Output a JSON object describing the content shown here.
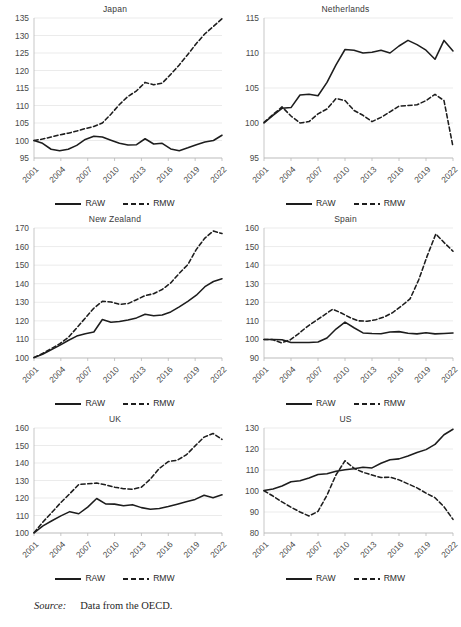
{
  "figure": {
    "source_label": "Source:",
    "source_text": "Data from the OECD.",
    "legend": {
      "raw": "RAW",
      "rmw": "RMW"
    },
    "colors": {
      "line": "#1d1d1d",
      "grid": "#e2e2e2",
      "axis": "#b9b9b9",
      "text": "#4a4a4a"
    }
  },
  "chart_data": [
    {
      "type": "line",
      "title": "Japan",
      "xlabel": "",
      "ylabel": "",
      "ylim": [
        95,
        135
      ],
      "yticks": [
        95,
        100,
        105,
        110,
        115,
        120,
        125,
        130,
        135
      ],
      "xlim": [
        2001,
        2022
      ],
      "xticks": [
        2001,
        2004,
        2007,
        2010,
        2013,
        2016,
        2019,
        2022
      ],
      "grid": true,
      "legend_position": "bottom",
      "x": [
        2001,
        2002,
        2003,
        2004,
        2005,
        2006,
        2007,
        2008,
        2009,
        2010,
        2011,
        2012,
        2013,
        2014,
        2015,
        2016,
        2017,
        2018,
        2019,
        2020,
        2021,
        2022
      ],
      "series": [
        {
          "name": "RAW",
          "style": "solid",
          "values": [
            100.0,
            99.2,
            97.5,
            97.1,
            97.5,
            98.6,
            100.3,
            101.2,
            101.0,
            100.1,
            99.2,
            98.7,
            98.8,
            100.5,
            99.0,
            99.2,
            97.6,
            97.1,
            97.9,
            98.8,
            99.6,
            100.0,
            101.5
          ]
        },
        {
          "name": "RMW",
          "style": "dashed",
          "values": [
            100.0,
            100.4,
            101.0,
            101.6,
            102.1,
            102.7,
            103.4,
            104.0,
            105.0,
            107.5,
            110.3,
            112.6,
            114.2,
            116.6,
            115.9,
            116.4,
            118.9,
            121.6,
            124.6,
            127.7,
            130.5,
            132.6,
            134.8
          ]
        }
      ]
    },
    {
      "type": "line",
      "title": "Netherlands",
      "xlabel": "",
      "ylabel": "",
      "ylim": [
        95,
        115
      ],
      "yticks": [
        95,
        100,
        105,
        110,
        115
      ],
      "xlim": [
        2001,
        2022
      ],
      "xticks": [
        2001,
        2004,
        2007,
        2010,
        2013,
        2016,
        2019,
        2022
      ],
      "grid": true,
      "legend_position": "bottom",
      "x": [
        2001,
        2002,
        2003,
        2004,
        2005,
        2006,
        2007,
        2008,
        2009,
        2010,
        2011,
        2012,
        2013,
        2014,
        2015,
        2016,
        2017,
        2018,
        2019,
        2020,
        2021,
        2022
      ],
      "series": [
        {
          "name": "RAW",
          "style": "solid",
          "values": [
            100.0,
            101.1,
            102.1,
            102.2,
            104.0,
            104.1,
            103.9,
            105.8,
            108.3,
            110.5,
            110.4,
            110.0,
            110.1,
            110.4,
            110.0,
            111.0,
            111.8,
            111.2,
            110.4,
            109.1,
            111.8,
            110.3
          ]
        },
        {
          "name": "RMW",
          "style": "dashed",
          "values": [
            100.1,
            101.2,
            102.3,
            101.0,
            100.0,
            100.2,
            101.3,
            102.0,
            103.5,
            103.2,
            101.8,
            101.1,
            100.2,
            100.8,
            101.6,
            102.4,
            102.5,
            102.6,
            103.2,
            104.1,
            103.2,
            96.6
          ]
        }
      ]
    },
    {
      "type": "line",
      "title": "New Zealand",
      "xlabel": "",
      "ylabel": "",
      "ylim": [
        100,
        170
      ],
      "yticks": [
        100,
        110,
        120,
        130,
        140,
        150,
        160,
        170
      ],
      "xlim": [
        2001,
        2022
      ],
      "xticks": [
        2001,
        2004,
        2007,
        2010,
        2013,
        2016,
        2019,
        2022
      ],
      "grid": true,
      "legend_position": "bottom",
      "x": [
        2001,
        2002,
        2003,
        2004,
        2005,
        2006,
        2007,
        2008,
        2009,
        2010,
        2011,
        2012,
        2013,
        2014,
        2015,
        2016,
        2017,
        2018,
        2019,
        2020,
        2021,
        2022
      ],
      "series": [
        {
          "name": "RAW",
          "style": "solid",
          "values": [
            100.2,
            102.0,
            104.4,
            106.8,
            109.4,
            111.8,
            113.1,
            114.0,
            120.7,
            119.3,
            119.6,
            120.5,
            121.6,
            123.6,
            122.8,
            123.2,
            124.8,
            127.5,
            130.5,
            133.8,
            138.4,
            141.2,
            142.7
          ]
        },
        {
          "name": "RMW",
          "style": "dashed",
          "values": [
            100.3,
            102.4,
            105.0,
            107.6,
            111.0,
            116.2,
            121.5,
            126.8,
            130.5,
            130.2,
            128.9,
            129.3,
            131.4,
            133.6,
            134.6,
            136.9,
            140.4,
            145.6,
            150.3,
            158.5,
            164.6,
            168.4,
            167.0
          ]
        }
      ]
    },
    {
      "type": "line",
      "title": "Spain",
      "xlabel": "",
      "ylabel": "",
      "ylim": [
        90,
        160
      ],
      "yticks": [
        90,
        100,
        110,
        120,
        130,
        140,
        150,
        160
      ],
      "xlim": [
        2001,
        2022
      ],
      "xticks": [
        2001,
        2004,
        2007,
        2010,
        2013,
        2016,
        2019,
        2022
      ],
      "grid": true,
      "legend_position": "bottom",
      "x": [
        2001,
        2002,
        2003,
        2004,
        2005,
        2006,
        2007,
        2008,
        2009,
        2010,
        2011,
        2012,
        2013,
        2014,
        2015,
        2016,
        2017,
        2018,
        2019,
        2020,
        2021,
        2022
      ],
      "series": [
        {
          "name": "RAW",
          "style": "solid",
          "values": [
            100.0,
            100.0,
            99.8,
            98.4,
            98.3,
            98.4,
            98.6,
            100.8,
            105.6,
            109.3,
            106.3,
            103.5,
            103.2,
            103.1,
            104.0,
            104.2,
            103.3,
            103.0,
            103.6,
            103.0,
            103.2,
            103.5
          ]
        },
        {
          "name": "RMW",
          "style": "dashed",
          "values": [
            100.0,
            99.9,
            98.2,
            99.6,
            103.0,
            106.8,
            110.0,
            113.1,
            116.3,
            114.2,
            111.8,
            110.0,
            109.8,
            110.6,
            112.1,
            114.5,
            118.0,
            121.8,
            132.0,
            145.0,
            156.8,
            152.0,
            147.5
          ]
        }
      ]
    },
    {
      "type": "line",
      "title": "UK",
      "xlabel": "",
      "ylabel": "",
      "ylim": [
        100,
        160
      ],
      "yticks": [
        100,
        110,
        120,
        130,
        140,
        150,
        160
      ],
      "xlim": [
        2001,
        2022
      ],
      "xticks": [
        2001,
        2004,
        2007,
        2010,
        2013,
        2016,
        2019,
        2022
      ],
      "grid": true,
      "legend_position": "bottom",
      "x": [
        2001,
        2002,
        2003,
        2004,
        2005,
        2006,
        2007,
        2008,
        2009,
        2010,
        2011,
        2012,
        2013,
        2014,
        2015,
        2016,
        2017,
        2018,
        2019,
        2020,
        2021,
        2022
      ],
      "series": [
        {
          "name": "RAW",
          "style": "solid",
          "values": [
            100.1,
            104.1,
            107.0,
            109.8,
            112.2,
            111.0,
            114.8,
            119.7,
            116.6,
            116.5,
            115.6,
            116.2,
            114.5,
            113.6,
            114.0,
            115.1,
            116.5,
            117.8,
            119.2,
            121.6,
            120.1,
            121.8
          ]
        },
        {
          "name": "RMW",
          "style": "dashed",
          "values": [
            100.2,
            106.3,
            111.8,
            117.4,
            122.5,
            127.7,
            128.1,
            128.6,
            127.5,
            126.2,
            125.3,
            125.0,
            126.2,
            130.8,
            136.9,
            140.8,
            141.6,
            144.6,
            149.8,
            154.8,
            156.9,
            153.5
          ]
        }
      ]
    },
    {
      "type": "line",
      "title": "US",
      "xlabel": "",
      "ylabel": "",
      "ylim": [
        80,
        130
      ],
      "yticks": [
        80,
        90,
        100,
        110,
        120,
        130
      ],
      "xlim": [
        2001,
        2022
      ],
      "xticks": [
        2001,
        2004,
        2007,
        2010,
        2013,
        2016,
        2019,
        2022
      ],
      "grid": true,
      "legend_position": "bottom",
      "x": [
        2001,
        2002,
        2003,
        2004,
        2005,
        2006,
        2007,
        2008,
        2009,
        2010,
        2011,
        2012,
        2013,
        2014,
        2015,
        2016,
        2017,
        2018,
        2019,
        2020,
        2021,
        2022
      ],
      "series": [
        {
          "name": "RAW",
          "style": "solid",
          "values": [
            100.2,
            101.0,
            102.4,
            104.4,
            104.9,
            106.2,
            107.9,
            108.2,
            109.4,
            110.1,
            110.6,
            111.3,
            111.0,
            113.2,
            114.9,
            115.3,
            116.7,
            118.3,
            119.7,
            122.2,
            126.8,
            129.4
          ]
        },
        {
          "name": "RMW",
          "style": "dashed",
          "values": [
            100.1,
            97.6,
            94.8,
            92.3,
            90.0,
            88.1,
            90.3,
            98.0,
            107.7,
            114.4,
            110.8,
            108.9,
            107.6,
            106.4,
            106.6,
            105.3,
            103.4,
            101.5,
            99.0,
            96.8,
            92.5,
            86.5
          ]
        }
      ]
    }
  ]
}
